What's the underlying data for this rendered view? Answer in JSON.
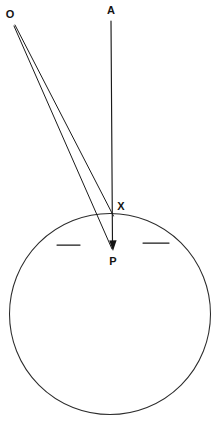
{
  "figure": {
    "width": 216,
    "height": 422,
    "background_color": "#ffffff",
    "ink_color": "#1a1a1a"
  },
  "labels": {
    "o": "O",
    "a": "A",
    "x": "X",
    "p": "P"
  },
  "points": {
    "o": {
      "label": "O",
      "x": 14,
      "y": 24,
      "label_x": 10,
      "label_y": 18
    },
    "a": {
      "label": "A",
      "x": 111,
      "y": 21,
      "label_x": 111,
      "label_y": 14
    },
    "x": {
      "label": "X",
      "x": 112,
      "y": 214,
      "label_x": 121,
      "label_y": 210
    },
    "p": {
      "label": "P",
      "x": 113,
      "y": 250,
      "label_x": 113,
      "label_y": 265
    }
  },
  "circle": {
    "name": "main-circle",
    "cx": 110,
    "cy": 314,
    "r": 100.5,
    "stroke": "#2b2b2b",
    "stroke_width": 1.05,
    "fill": "none"
  },
  "segments": [
    {
      "name": "ray-o-to-x",
      "from": "O",
      "to": "X",
      "x1": 15,
      "y1": 25,
      "x2": 113.5,
      "y2": 216,
      "stroke_width": 1.0
    },
    {
      "name": "ray-o-to-p",
      "from": "O",
      "to": "P",
      "x1": 14,
      "y1": 26,
      "x2": 112,
      "y2": 249,
      "stroke_width": 1.0
    },
    {
      "name": "axis-a-to-p",
      "from": "A",
      "to": "P",
      "x1": 111,
      "y1": 21,
      "x2": 112.5,
      "y2": 245,
      "stroke_width": 1.15
    }
  ],
  "arrow": {
    "name": "arrowhead-at-p",
    "tip_x": 113,
    "tip_y": 251,
    "points": "113,251 109.2,240.5 116.6,240.2"
  },
  "tick_marks": [
    {
      "name": "tick-left",
      "x1": 57,
      "y1": 245,
      "x2": 80,
      "y2": 245,
      "stroke_width": 1.25
    },
    {
      "name": "tick-right",
      "x1": 143,
      "y1": 243,
      "x2": 169,
      "y2": 243,
      "stroke_width": 1.25
    }
  ]
}
